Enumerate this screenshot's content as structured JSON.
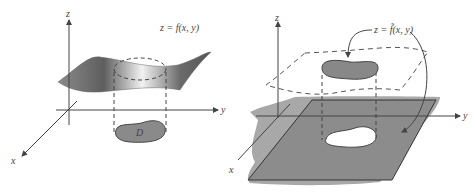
{
  "left_panel": {
    "axis_z": "z",
    "axis_y": "y",
    "axis_x": "x",
    "surface_label": "z = f(x, y)",
    "region_label": "D"
  },
  "right_panel": {
    "axis_z": "z",
    "axis_y": "y",
    "axis_x": "x",
    "surface_label": "z = f̃(x, y)"
  },
  "colors": {
    "axis": "#444444",
    "surface_dark": "#6f6f6f",
    "surface_light": "#f0f0f0",
    "region_fill": "#8a8a8a",
    "plane_fill": "#8c8c8c"
  }
}
